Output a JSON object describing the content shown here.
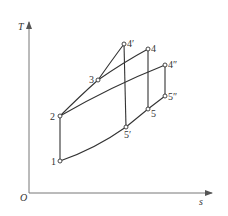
{
  "diagram": {
    "type": "T-s diagram",
    "axes": {
      "y_label": "T",
      "x_label": "s",
      "origin_label": "O"
    },
    "points": [
      {
        "id": "p1",
        "label": "1",
        "x": 60,
        "y": 161
      },
      {
        "id": "p2",
        "label": "2",
        "x": 60,
        "y": 116
      },
      {
        "id": "p3",
        "label": "3",
        "x": 98,
        "y": 80
      },
      {
        "id": "p4prime",
        "label": "4′",
        "x": 124,
        "y": 44
      },
      {
        "id": "p4",
        "label": "4",
        "x": 148,
        "y": 49
      },
      {
        "id": "p4dprime",
        "label": "4″",
        "x": 165,
        "y": 65
      },
      {
        "id": "p5prime",
        "label": "5′",
        "x": 126,
        "y": 127
      },
      {
        "id": "p5",
        "label": "5",
        "x": 148,
        "y": 109
      },
      {
        "id": "p5dprime",
        "label": "5″",
        "x": 165,
        "y": 96
      }
    ],
    "colors": {
      "line": "#333333",
      "axis": "#666666",
      "background": "#ffffff"
    }
  }
}
